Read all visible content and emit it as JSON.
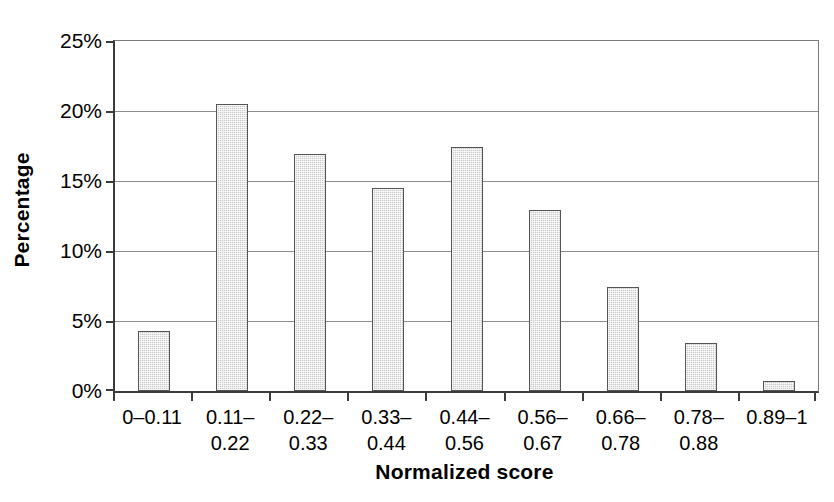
{
  "chart_data": {
    "type": "bar",
    "title": "",
    "subtitle": "",
    "xlabel": "Normalized score",
    "ylabel": "Percentage",
    "categories": [
      "0–0.11",
      "0.11–\n0.22",
      "0.22–\n0.33",
      "0.33–\n0.44",
      "0.44–\n0.56",
      "0.56–\n0.67",
      "0.66–\n0.78",
      "0.78–\n0.88",
      "0.89–1"
    ],
    "category_lines": [
      [
        "0–0.11"
      ],
      [
        "0.11–",
        "0.22"
      ],
      [
        "0.22–",
        "0.33"
      ],
      [
        "0.33–",
        "0.44"
      ],
      [
        "0.44–",
        "0.56"
      ],
      [
        "0.56–",
        "0.67"
      ],
      [
        "0.66–",
        "0.78"
      ],
      [
        "0.78–",
        "0.88"
      ],
      [
        "0.89–1"
      ]
    ],
    "values": [
      4.3,
      20.5,
      16.9,
      14.5,
      17.4,
      12.9,
      7.4,
      3.4,
      0.7
    ],
    "ylim": [
      0,
      25
    ],
    "ytick_values": [
      0,
      5,
      10,
      15,
      20,
      25
    ],
    "ytick_labels": [
      "0%",
      "5%",
      "10%",
      "15%",
      "20%",
      "25%"
    ],
    "grid": "horizontal",
    "legend": "none",
    "bar_fill_color": "#c9c9c9",
    "bar_border_color": "#545454",
    "axis_color": "#3b3b3b",
    "gridline_color": "#8c8c8c"
  }
}
